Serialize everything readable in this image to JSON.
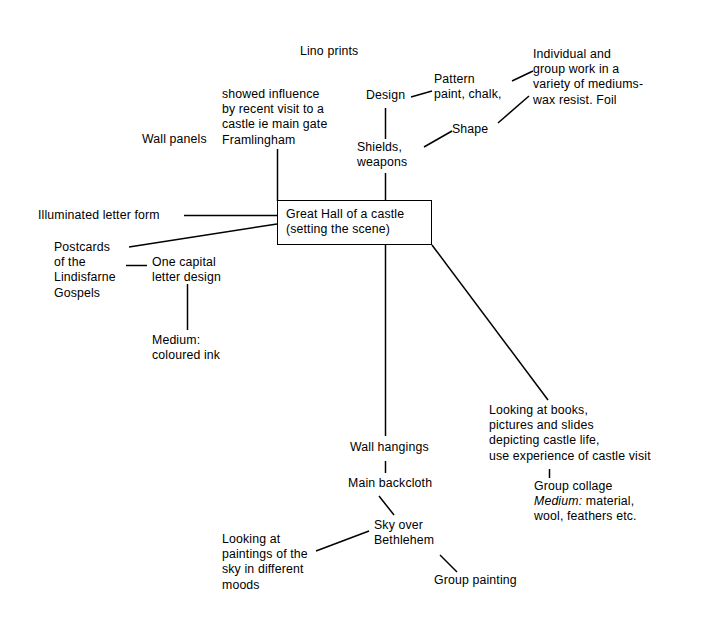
{
  "diagram": {
    "type": "mind-map",
    "center": {
      "line1": "Great Hall of a castle",
      "line2": "(setting the scene)",
      "full": "Great Hall of a castle (setting the scene)"
    },
    "nodes": {
      "lino_prints": "Lino prints",
      "wall_panels": "Wall panels",
      "showed_influence": "showed influence\nby recent visit to a\ncastle ie main gate\nFramlingham",
      "design": "Design",
      "pattern_paint_chalk": "Pattern\npaint, chalk,",
      "shape": "Shape",
      "individual_group_work": "Individual and\ngroup work in a\nvariety of mediums-\nwax resist. Foil",
      "shields_weapons": "Shields,\nweapons",
      "illuminated_letter_form": "Illuminated letter form",
      "postcards_lindisfarne": "Postcards\nof the\nLindisfarne\nGospels",
      "one_capital_letter_design": "One capital\nletter design",
      "medium_coloured_ink": "Medium:\ncoloured ink",
      "looking_at_books": "Looking at books,\npictures and slides\ndepicting castle life,\nuse experience of castle visit",
      "group_collage": "Group collage",
      "group_collage_medium_label": "Medium:",
      "group_collage_medium_rest": " material,",
      "group_collage_materials": "wool, feathers etc.",
      "wall_hangings": "Wall hangings",
      "main_backcloth": "Main backcloth",
      "sky_over_bethlehem": "Sky over\nBethlehem",
      "looking_at_paintings": "Looking at\npaintings of the\nsky in different\nmoods",
      "group_painting": "Group painting"
    },
    "colors": {
      "background": "#ffffff",
      "ink": "#000000",
      "node_border": "#000000"
    }
  }
}
